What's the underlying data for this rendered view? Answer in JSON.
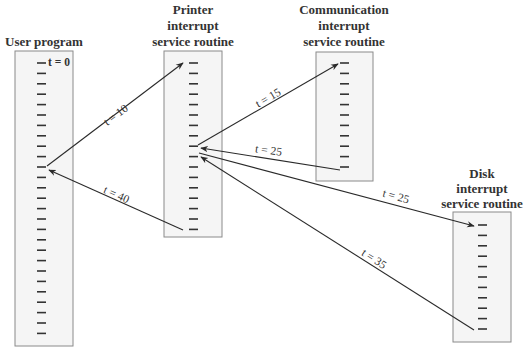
{
  "routines": [
    {
      "id": "user",
      "title_lines": [
        "User program"
      ],
      "box": {
        "x": 15,
        "y": 51,
        "w": 58,
        "h": 295
      },
      "tick_x": 37,
      "tick_start": 63,
      "tick_count": 27,
      "title_y": [
        46
      ],
      "title_cx": 44
    },
    {
      "id": "printer",
      "title_lines": [
        "Printer",
        "interrupt",
        "service routine"
      ],
      "box": {
        "x": 164,
        "y": 51,
        "w": 58,
        "h": 186
      },
      "tick_x": 189,
      "tick_start": 63,
      "tick_count": 17,
      "title_y": [
        14,
        30,
        46
      ],
      "title_cx": 193
    },
    {
      "id": "communication",
      "title_lines": [
        "Communication",
        "interrupt",
        "service routine"
      ],
      "box": {
        "x": 316,
        "y": 52,
        "w": 57,
        "h": 129
      },
      "tick_x": 340,
      "tick_start": 63,
      "tick_count": 11,
      "title_y": [
        14,
        30,
        46
      ],
      "title_cx": 344
    },
    {
      "id": "disk",
      "title_lines": [
        "Disk",
        "interrupt",
        "service routine"
      ],
      "box": {
        "x": 453,
        "y": 212,
        "w": 58,
        "h": 130
      },
      "tick_x": 478,
      "tick_start": 225,
      "tick_count": 11,
      "title_y": [
        178,
        193,
        208
      ],
      "title_cx": 482
    }
  ],
  "tick_spacing": 10.4,
  "start_label": {
    "text": "t = 0",
    "x": 48,
    "y": 66
  },
  "transfers": [
    {
      "from": [
        47,
        166
      ],
      "to": [
        183,
        63
      ],
      "label": "t = 10",
      "label_pos": [
        118,
        118
      ],
      "angle": -37
    },
    {
      "from": [
        198,
        145
      ],
      "to": [
        338,
        64
      ],
      "label": "t = 15",
      "label_pos": [
        270,
        101
      ],
      "angle": -30
    },
    {
      "from": [
        340,
        170
      ],
      "to": [
        201,
        148
      ],
      "label": "t = 25",
      "label_pos": [
        268,
        154
      ],
      "angle": 8
    },
    {
      "from": [
        199,
        153
      ],
      "to": [
        474,
        226
      ],
      "label": "t = 25",
      "label_pos": [
        395,
        200
      ],
      "angle": 15
    },
    {
      "from": [
        474,
        330
      ],
      "to": [
        201,
        157
      ],
      "label": "t = 35",
      "label_pos": [
        372,
        262
      ],
      "angle": 33
    },
    {
      "from": [
        183,
        230
      ],
      "to": [
        49,
        170
      ],
      "label": "t = 40",
      "label_pos": [
        115,
        198
      ],
      "angle": 24
    }
  ],
  "colors": {
    "box_fill": "#f5f5f5",
    "box_stroke": "#8a8a8a",
    "ink": "#2a2a2a"
  }
}
